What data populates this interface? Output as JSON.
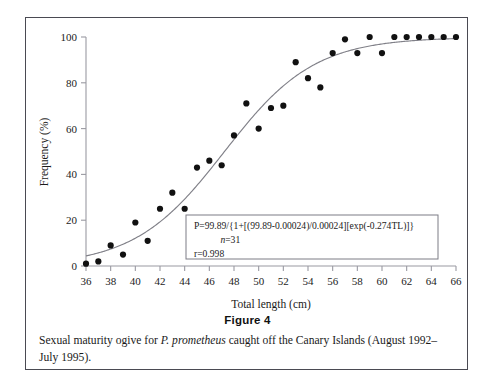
{
  "figure": {
    "number_label": "Figure 4",
    "caption_prefix": "Sexual maturity ogive for ",
    "caption_species": "P. prometheus",
    "caption_suffix": " caught off the Canary Islands (August 1992–July 1995)."
  },
  "annotation_box": {
    "equation": "P=99.89/{1+[(99.89-0.00024)/0.00024][exp(-0.274TL)]}",
    "n_symbol": "n",
    "n_value": "=31",
    "r_line": "r=0.998"
  },
  "chart_data": {
    "type": "scatter",
    "title": "",
    "xlabel": "Total length (cm)",
    "ylabel": "Frequency (%)",
    "xlim": [
      36,
      66
    ],
    "ylim": [
      0,
      100
    ],
    "xticks": [
      36,
      38,
      40,
      42,
      44,
      46,
      48,
      50,
      52,
      54,
      56,
      58,
      60,
      62,
      64,
      66
    ],
    "yticks": [
      0,
      20,
      40,
      60,
      80,
      100
    ],
    "xtick_labels": [
      "36",
      "38",
      "40",
      "42",
      "44",
      "46",
      "48",
      "50",
      "52",
      "54",
      "56",
      "58",
      "60",
      "62",
      "64",
      "66"
    ],
    "ytick_labels": [
      "0",
      "20",
      "40",
      "60",
      "80",
      "100"
    ],
    "grid": false,
    "legend": false,
    "marker_color": "#111111",
    "curve_color": "#808088",
    "axis_color": "#9a9aa2",
    "x": [
      36,
      37,
      38,
      39,
      40,
      41,
      42,
      43,
      44,
      45,
      46,
      47,
      48,
      49,
      50,
      51,
      52,
      53,
      54,
      55,
      56,
      57,
      58,
      59,
      60,
      61,
      62,
      63,
      64,
      65,
      66
    ],
    "values": [
      1,
      2,
      9,
      5,
      19,
      11,
      25,
      32,
      25,
      43,
      46,
      44,
      57,
      71,
      60,
      69,
      70,
      89,
      82,
      78,
      93,
      99,
      93,
      100,
      93,
      100,
      100,
      100,
      100,
      100,
      100
    ],
    "series": [
      {
        "name": "observed frequency",
        "values": [
          1,
          2,
          9,
          5,
          19,
          11,
          25,
          32,
          25,
          43,
          46,
          44,
          57,
          71,
          60,
          69,
          70,
          89,
          82,
          78,
          93,
          99,
          93,
          100,
          93,
          100,
          100,
          100,
          100,
          100,
          100
        ]
      },
      {
        "name": "fitted logistic ogive",
        "model": "P=99.89/{1+[(99.89-0.00024)/0.00024][exp(-0.274TL)]}",
        "asymptote": 99.89,
        "rate": 0.274,
        "n": 31,
        "r": 0.998
      }
    ]
  }
}
